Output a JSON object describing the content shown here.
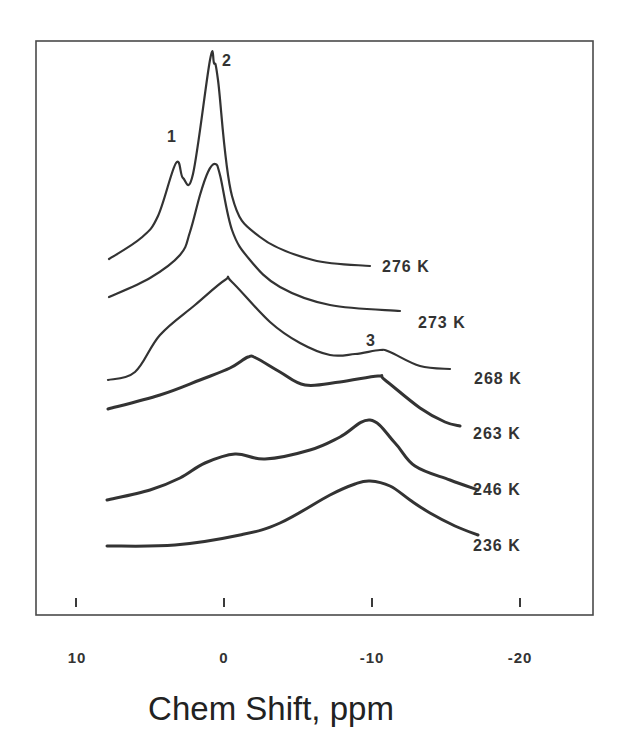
{
  "chart_data": {
    "type": "line",
    "title": "",
    "xlabel": "Chem Shift, ppm",
    "ylabel": "",
    "xlim": [
      13,
      -25
    ],
    "x_reversed": true,
    "grid": false,
    "legend": "inline labels at right end of each trace",
    "x_ticks": [
      10,
      0,
      -10,
      -20
    ],
    "x_tick_labels": [
      "10",
      "0",
      "-10",
      "-20"
    ],
    "series": [
      {
        "name": "276 K",
        "peaks_ppm": [
          {
            "label": "1",
            "ppm": 3.3
          },
          {
            "label": "2",
            "ppm": 1.0
          }
        ],
        "points_px": [
          [
            109,
            259
          ],
          [
            141,
            238
          ],
          [
            158,
            216
          ],
          [
            176,
            163
          ],
          [
            183,
            178
          ],
          [
            193,
            174
          ],
          [
            210,
            60
          ],
          [
            214,
            63
          ],
          [
            218,
            80
          ],
          [
            232,
            196
          ],
          [
            260,
            237
          ],
          [
            313,
            260
          ],
          [
            370,
            266
          ]
        ]
      },
      {
        "name": "273 K",
        "peaks_ppm": [
          {
            "ppm": 0.6
          }
        ],
        "points_px": [
          [
            109,
            297
          ],
          [
            150,
            278
          ],
          [
            180,
            255
          ],
          [
            190,
            232
          ],
          [
            200,
            195
          ],
          [
            208,
            172
          ],
          [
            215,
            164
          ],
          [
            220,
            175
          ],
          [
            232,
            230
          ],
          [
            250,
            260
          ],
          [
            280,
            287
          ],
          [
            330,
            305
          ],
          [
            400,
            311
          ]
        ]
      },
      {
        "name": "268 K",
        "peaks_ppm": [
          {
            "ppm": -0.2
          },
          {
            "label": "3",
            "ppm": -10.7
          }
        ],
        "points_px": [
          [
            108,
            380
          ],
          [
            135,
            372
          ],
          [
            160,
            335
          ],
          [
            195,
            305
          ],
          [
            225,
            280
          ],
          [
            232,
            282
          ],
          [
            270,
            322
          ],
          [
            300,
            343
          ],
          [
            330,
            355
          ],
          [
            355,
            354
          ],
          [
            380,
            350
          ],
          [
            390,
            352
          ],
          [
            420,
            366
          ],
          [
            450,
            369
          ]
        ]
      },
      {
        "name": "263 K",
        "peaks_ppm": [
          {
            "ppm": -1.7
          },
          {
            "ppm": -10.5
          }
        ],
        "points_px": [
          [
            108,
            409
          ],
          [
            160,
            395
          ],
          [
            200,
            380
          ],
          [
            230,
            368
          ],
          [
            248,
            357
          ],
          [
            256,
            358
          ],
          [
            280,
            372
          ],
          [
            305,
            385
          ],
          [
            340,
            382
          ],
          [
            378,
            376
          ],
          [
            385,
            380
          ],
          [
            420,
            408
          ],
          [
            445,
            422
          ],
          [
            460,
            426
          ]
        ]
      },
      {
        "name": "246 K",
        "peaks_ppm": [
          {
            "ppm": -0.8
          },
          {
            "ppm": -9.9
          }
        ],
        "points_px": [
          [
            107,
            500
          ],
          [
            150,
            490
          ],
          [
            180,
            478
          ],
          [
            205,
            463
          ],
          [
            235,
            454
          ],
          [
            265,
            459
          ],
          [
            310,
            450
          ],
          [
            340,
            437
          ],
          [
            370,
            420
          ],
          [
            395,
            443
          ],
          [
            415,
            466
          ],
          [
            450,
            480
          ],
          [
            478,
            490
          ]
        ]
      },
      {
        "name": "236 K",
        "peaks_ppm": [
          {
            "ppm": -10.0
          }
        ],
        "points_px": [
          [
            107,
            546
          ],
          [
            175,
            545
          ],
          [
            240,
            535
          ],
          [
            280,
            523
          ],
          [
            330,
            495
          ],
          [
            355,
            484
          ],
          [
            370,
            481
          ],
          [
            390,
            486
          ],
          [
            410,
            500
          ],
          [
            430,
            513
          ],
          [
            455,
            526
          ],
          [
            478,
            535
          ]
        ]
      }
    ],
    "series_labels_px": [
      [
        382,
        272
      ],
      [
        418,
        328
      ],
      [
        474,
        384
      ],
      [
        473,
        439
      ],
      [
        473,
        495
      ],
      [
        473,
        551
      ]
    ],
    "peak_labels": [
      {
        "text": "1",
        "x": 167,
        "y": 142
      },
      {
        "text": "2",
        "x": 222,
        "y": 66
      },
      {
        "text": "3",
        "x": 366,
        "y": 346
      }
    ]
  },
  "axis": {
    "xlabel": "Chem Shift, ppm",
    "tick_labels": [
      "10",
      "0",
      "-10",
      "-20"
    ]
  },
  "labels": {
    "s0": "276 K",
    "s1": "273 K",
    "s2": "268 K",
    "s3": "263 K",
    "s4": "246 K",
    "s5": "236 K",
    "p1": "1",
    "p2": "2",
    "p3": "3"
  }
}
